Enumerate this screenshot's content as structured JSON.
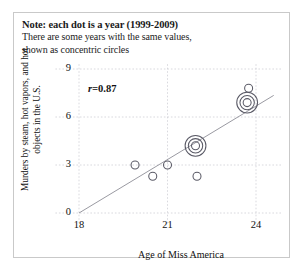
{
  "note": {
    "title": "Note: each dot is a year (1999-2009)",
    "line2": "There are some years with the same values,",
    "line3": "shown as concentric circles"
  },
  "annotation": {
    "corr_label": "r=",
    "corr_value": "0.87"
  },
  "colors": {
    "background": "#ffffff",
    "frame_border": "#c9c9c9",
    "grid": "#cfcfd6",
    "marker_stroke": "#5a5a66",
    "trend_line": "#9a9aa2",
    "text": "#111111"
  },
  "chart_data": {
    "type": "scatter",
    "title": "Note: each dot is a year (1999-2009)",
    "subtitle": "There are some years with the same values, shown as concentric circles",
    "xlabel": "Age of Miss America",
    "ylabel": "Murders by steam, hot vapors, and hot objects in the U.S.",
    "xlim": [
      17.2,
      24.9
    ],
    "ylim": [
      -0.75,
      9.3
    ],
    "xticks": [
      18,
      21,
      24
    ],
    "yticks": [
      0,
      3,
      6,
      9
    ],
    "grid": true,
    "legend": null,
    "correlation": 0.87,
    "points": [
      {
        "x": 19.9,
        "y": 3.0,
        "rings": 1
      },
      {
        "x": 21.0,
        "y": 3.0,
        "rings": 1
      },
      {
        "x": 20.5,
        "y": 2.3,
        "rings": 1
      },
      {
        "x": 22.0,
        "y": 2.3,
        "rings": 1
      },
      {
        "x": 21.95,
        "y": 4.2,
        "rings": 3
      },
      {
        "x": 23.7,
        "y": 6.9,
        "rings": 3
      },
      {
        "x": 23.75,
        "y": 7.8,
        "rings": 1
      }
    ],
    "trend_line": {
      "x0": 18.0,
      "y0": 0.0,
      "x1": 24.6,
      "y1": 7.35
    }
  }
}
